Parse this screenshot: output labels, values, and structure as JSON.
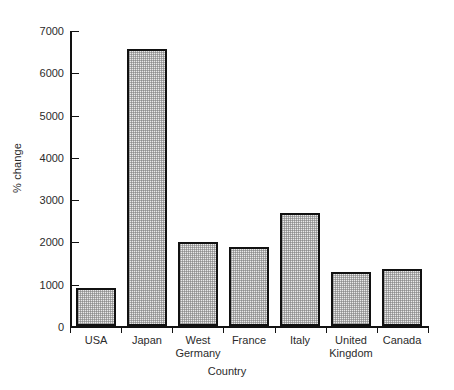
{
  "chart_data": {
    "type": "bar",
    "title": "",
    "xlabel": "Country",
    "ylabel": "% change",
    "categories": [
      "USA",
      "Japan",
      "West\nGermany",
      "France",
      "Italy",
      "United\nKingdom",
      "Canada"
    ],
    "values": [
      900,
      6550,
      1990,
      1880,
      2670,
      1270,
      1340
    ],
    "ylim": [
      0,
      7000
    ],
    "ytick_labels": [
      "0",
      "1000",
      "2000",
      "3000",
      "4000",
      "5000",
      "6000",
      "7000"
    ],
    "ytick_values": [
      0,
      1000,
      2000,
      3000,
      4000,
      5000,
      6000,
      7000
    ],
    "grid": false,
    "legend": false,
    "bar_fill": "#e9e9e9",
    "bar_edge": "#111111",
    "axis_color": "#121212",
    "background": "#ffffff"
  }
}
